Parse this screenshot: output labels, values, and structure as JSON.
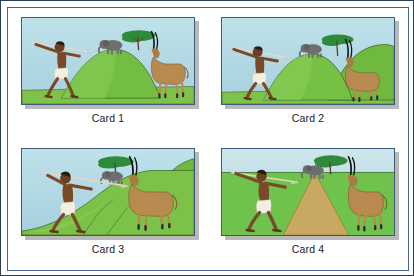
{
  "figure": {
    "title": "",
    "card_count": 4
  },
  "palette": {
    "sky": "#aed4e0",
    "sky_light": "#bfe0e8",
    "grass_light": "#8cc63f",
    "grass_mid": "#6db33f",
    "grass_dark": "#4f9a32",
    "grass_flat": "#6cbе55",
    "hill_green": "#7cc242",
    "tree_canopy": "#2f8f3e",
    "tree_trunk": "#6b4a2a",
    "elephant": "#6f6f6f",
    "antelope_body": "#b98a50",
    "antelope_dark": "#8a5f33",
    "horn_black": "#141414",
    "skin": "#7a4a28",
    "skin_dark": "#5d3620",
    "loincloth": "#f2efe2",
    "spear": "#d8d4c4",
    "path_tan": "#c9a961",
    "card_border": "#3d5a78",
    "frame_border": "#46648c",
    "outer_border": "#2c3e54",
    "shadow": "#b9b9b9",
    "label_text": "#1a1a1a",
    "page_bg": "#ffffff"
  },
  "cards": [
    {
      "id": "card-1",
      "label": "Card 1",
      "scene": "hunter-throwing-spear-hill-elephant-antelope",
      "ground": "hill",
      "has_path": false,
      "elements": [
        "hunter",
        "spear",
        "hill",
        "elephant",
        "acacia-tree",
        "antelope"
      ]
    },
    {
      "id": "card-2",
      "label": "Card 2",
      "scene": "hunter-throwing-spear-hills-elephant-antelope",
      "ground": "hills",
      "has_path": false,
      "elements": [
        "hunter",
        "spear",
        "hills",
        "elephant",
        "acacia-tree",
        "antelope"
      ]
    },
    {
      "id": "card-3",
      "label": "Card 3",
      "scene": "hunter-throwing-spear-slope-elephant-antelope",
      "ground": "slope",
      "has_path": false,
      "elements": [
        "hunter",
        "spear",
        "slope",
        "elephant",
        "acacia-tree",
        "antelope"
      ]
    },
    {
      "id": "card-4",
      "label": "Card 4",
      "scene": "hunter-throwing-spear-flat-plain-path-elephant-antelope",
      "ground": "flat-plain",
      "has_path": true,
      "elements": [
        "hunter",
        "spear",
        "flat-plain",
        "tan-path",
        "elephant",
        "acacia-tree",
        "antelope"
      ]
    }
  ]
}
